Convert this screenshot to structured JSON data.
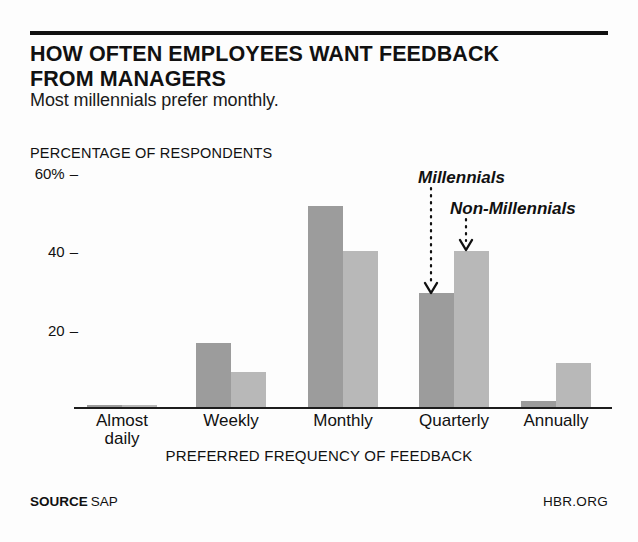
{
  "header": {
    "title_line1": "HOW OFTEN EMPLOYEES WANT FEEDBACK",
    "title_line2": "FROM MANAGERS",
    "subtitle": "Most millennials prefer monthly."
  },
  "footer": {
    "source_label": "SOURCE",
    "source_value": "SAP",
    "brand": "HBR.ORG"
  },
  "annotations": {
    "millennials": "Millennials",
    "non_millennials": "Non-Millennials"
  },
  "axis": {
    "y_title": "PERCENTAGE OF RESPONDENTS",
    "x_title": "PREFERRED FREQUENCY OF FEEDBACK",
    "y_ticks": [
      "60%",
      "40",
      "20"
    ],
    "tick_dash": "–"
  },
  "colors": {
    "millennials_bar": "#9c9c9c",
    "non_millennials_bar": "#b8b8b8",
    "rule": "#111111",
    "background": "#fdfdfd"
  },
  "chart_data": {
    "type": "bar",
    "title": "HOW OFTEN EMPLOYEES WANT FEEDBACK FROM MANAGERS",
    "subtitle": "Most millennials prefer monthly.",
    "xlabel": "PREFERRED FREQUENCY OF FEEDBACK",
    "ylabel": "PERCENTAGE OF RESPONDENTS",
    "ylim": [
      0,
      60
    ],
    "yticks": [
      20,
      40,
      60
    ],
    "grid": false,
    "legend": "annotated-arrows",
    "categories": [
      "Almost daily",
      "Weekly",
      "Monthly",
      "Quarterly",
      "Annually"
    ],
    "series": [
      {
        "name": "Millennials",
        "values": [
          1,
          16,
          49,
          28,
          2
        ]
      },
      {
        "name": "Non-Millennials",
        "values": [
          1,
          9,
          38,
          38,
          11
        ]
      }
    ],
    "source": "SAP"
  },
  "categories_render": [
    {
      "label": "Almost\ndaily",
      "center": 122,
      "mill": 1,
      "nonmill": 1
    },
    {
      "label": "Weekly",
      "center": 231,
      "mill": 16,
      "nonmill": 9
    },
    {
      "label": "Monthly",
      "center": 343,
      "mill": 49,
      "nonmill": 38
    },
    {
      "label": "Quarterly",
      "center": 454,
      "mill": 28,
      "nonmill": 38
    },
    {
      "label": "Annually",
      "center": 556,
      "mill": 2,
      "nonmill": 11
    }
  ]
}
